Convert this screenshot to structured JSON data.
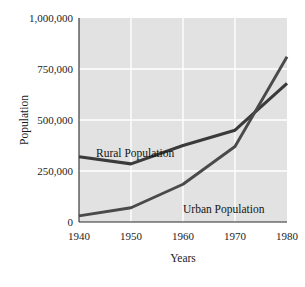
{
  "chart_data": {
    "type": "line",
    "title": "",
    "xlabel": "Years",
    "ylabel": "Population",
    "x": [
      1940,
      1950,
      1960,
      1970,
      1980
    ],
    "xticklabels": [
      "1940",
      "1950",
      "1960",
      "1970",
      "1980"
    ],
    "xlim": [
      1940,
      1980
    ],
    "ylim": [
      0,
      1000000
    ],
    "yticks": [
      0,
      250000,
      500000,
      750000,
      1000000
    ],
    "yticklabels": [
      "0",
      "250,000",
      "500,000",
      "750,000",
      "1,000,000"
    ],
    "grid": true,
    "legend_position": "inline-annotations",
    "plot_background": "#e2e2e2",
    "gridline_color": "#ffffff",
    "line_color": "#3a3a3a",
    "series": [
      {
        "name": "Rural Population",
        "label": "Rural Population",
        "values": [
          320000,
          285000,
          375000,
          450000,
          680000
        ]
      },
      {
        "name": "Urban Population",
        "label": "Urban Population",
        "values": [
          30000,
          70000,
          185000,
          370000,
          810000
        ]
      }
    ],
    "annotations": [
      {
        "text": "Rural Population",
        "x": 1946.5,
        "y": 420000
      },
      {
        "text": "Urban Population",
        "x": 1966.0,
        "y": 135000
      }
    ]
  }
}
